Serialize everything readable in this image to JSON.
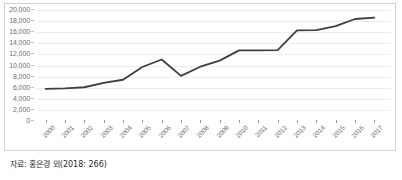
{
  "figure": {
    "source_note": "자료: 홍은경 외(2018: 266)"
  },
  "chart_data": {
    "type": "line",
    "title": "",
    "xlabel": "",
    "ylabel": "",
    "categories": [
      "2000",
      "2001",
      "2002",
      "2003",
      "2004",
      "2005",
      "2006",
      "2007",
      "2008",
      "2009",
      "2010",
      "2011",
      "2012",
      "2013",
      "2014",
      "2015",
      "2016",
      "2017"
    ],
    "values": [
      5600,
      5700,
      5900,
      6700,
      7250,
      9550,
      10900,
      7950,
      9600,
      10700,
      12550,
      12550,
      12600,
      16150,
      16200,
      16900,
      18200,
      18450
    ],
    "series": [
      {
        "name": "",
        "values": [
          5600,
          5700,
          5900,
          6700,
          7250,
          9550,
          10900,
          7950,
          9600,
          10700,
          12550,
          12550,
          12600,
          16150,
          16200,
          16900,
          18200,
          18450
        ]
      }
    ],
    "ylim": [
      0,
      20000
    ],
    "ytick_values": [
      0,
      2000,
      4000,
      6000,
      8000,
      10000,
      12000,
      14000,
      16000,
      18000,
      20000
    ],
    "ytick_labels": [
      "0",
      "2,000",
      "4,000",
      "6,000",
      "8,000",
      "10,000",
      "12,000",
      "14,000",
      "16,000",
      "18,000",
      "20,000"
    ],
    "grid": true,
    "legend": false,
    "legend_position": "none",
    "line_color": "#3f3f3f",
    "grid_color": "#ededed",
    "axis_color": "#8c8c8c",
    "background_color": "#ffffff"
  }
}
